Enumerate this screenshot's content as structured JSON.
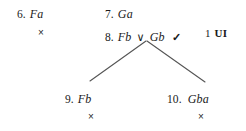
{
  "diagram": {
    "type": "logic-truth-tree",
    "background_color": "#ffffff",
    "text_color": "#1a1a1a",
    "line_color": "#555555"
  },
  "lines": {
    "line6": {
      "number": "6.",
      "formula": "Fa",
      "closure_mark": "×"
    },
    "line7": {
      "number": "7.",
      "formula": "Ga"
    },
    "line8": {
      "number": "8.",
      "left_disjunct": "Fb",
      "connective": "∨",
      "right_disjunct": "Gb",
      "check": "✓",
      "justification_number": "1",
      "justification_rule": "UI"
    },
    "line9": {
      "number": "9.",
      "formula": "Fb",
      "closure_mark": "×"
    },
    "line10": {
      "number": "10.",
      "formula": "Gba",
      "closure_mark": "×"
    }
  }
}
